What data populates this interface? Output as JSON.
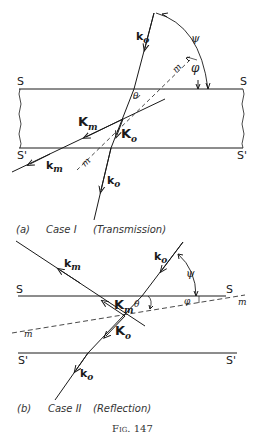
{
  "figure": {
    "caption": "Fig. 147",
    "panels": [
      {
        "id": "a",
        "label": "(a)",
        "case": "Case I",
        "mode": "(Transmission)",
        "surfaces": {
          "top": "S",
          "bottom": "S'"
        },
        "vectors": {
          "incident": "k",
          "incident_sub": "o",
          "internal_o": "K",
          "internal_o_sub": "o",
          "internal_m": "K",
          "internal_m_sub": "m",
          "exit_m": "k",
          "exit_m_sub": "m",
          "exit_o": "k",
          "exit_o_sub": "o"
        },
        "angles": {
          "psi": "ψ",
          "phi": "φ",
          "theta": "θ"
        },
        "plane_label": "m"
      },
      {
        "id": "b",
        "label": "(b)",
        "case": "Case II",
        "mode": "(Reflection)",
        "surfaces": {
          "top": "S",
          "bottom": "S'"
        },
        "vectors": {
          "incident": "k",
          "incident_sub": "o",
          "internal_o": "K",
          "internal_o_sub": "o",
          "internal_m": "K",
          "internal_m_sub": "m",
          "exit_m": "k",
          "exit_m_sub": "m",
          "exit_o": "k",
          "exit_o_sub": "o"
        },
        "angles": {
          "psi": "ψ",
          "phi": "φ",
          "theta": "θ"
        },
        "plane_label": "m"
      }
    ]
  },
  "colors": {
    "ink": "#1a1a1a",
    "background": "#ffffff"
  }
}
